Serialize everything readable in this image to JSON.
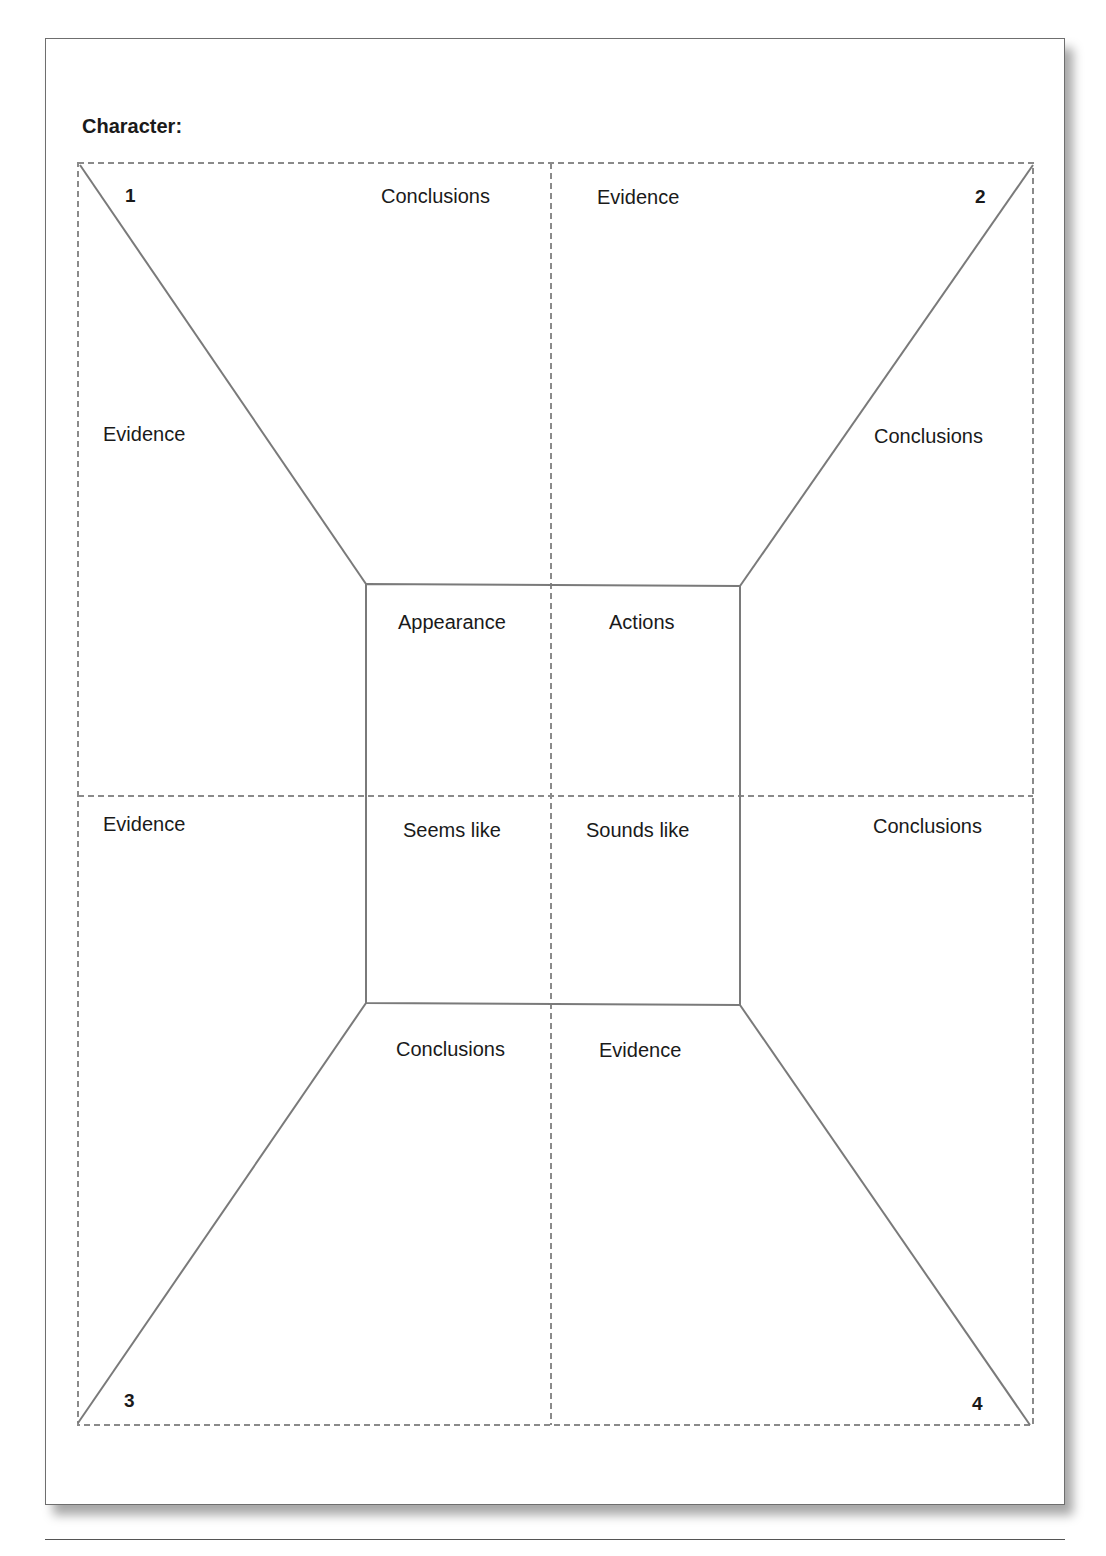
{
  "worksheet": {
    "title": "Character:",
    "quadrants": [
      {
        "number": "1",
        "outer_labels": {
          "top": "Conclusions",
          "side": "Evidence"
        }
      },
      {
        "number": "2",
        "outer_labels": {
          "top": "Evidence",
          "side": "Conclusions"
        }
      },
      {
        "number": "3",
        "outer_labels": {
          "bottom": "Conclusions",
          "side": "Evidence"
        }
      },
      {
        "number": "4",
        "outer_labels": {
          "bottom": "Evidence",
          "side": "Conclusions"
        }
      }
    ],
    "center": {
      "top_left": "Appearance",
      "top_right": "Actions",
      "bottom_left": "Seems like",
      "bottom_right": "Sounds like"
    },
    "labels": {
      "q1_top": "Conclusions",
      "q1_side": "Evidence",
      "q2_top": "Evidence",
      "q2_side": "Conclusions",
      "q3_side": "Evidence",
      "q3_bottom": "Conclusions",
      "q4_side": "Conclusions",
      "q4_bottom": "Evidence",
      "num1": "1",
      "num2": "2",
      "num3": "3",
      "num4": "4"
    },
    "colors": {
      "line": "#7a7a7a",
      "dash": "#8a8a8a",
      "text": "#1a1a1a"
    }
  }
}
